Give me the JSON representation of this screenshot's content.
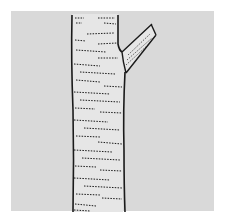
{
  "illustration": {
    "subject": "Tree trunk with cut branch stub",
    "alt": "Line drawing of a tree trunk with horizontal bark markings and a short pruned branch on the right side",
    "colors": {
      "page": "#ffffff",
      "panel": "#d9d9d9",
      "trunk_fill": "#e6e6e6",
      "ink": "#1a1a1a"
    }
  }
}
